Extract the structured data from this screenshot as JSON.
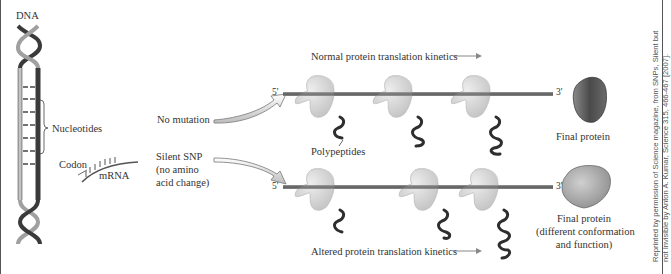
{
  "figure": {
    "labels": {
      "dna": "DNA",
      "nucleotides": "Nucleotides",
      "codon": "Codon",
      "mrna": "mRNA",
      "no_mutation": "No mutation",
      "silent_snp_line1": "Silent SNP",
      "silent_snp_line2": "(no amino",
      "silent_snp_line3": "acid change)",
      "normal_kinetics": "Normal protein translation kinetics",
      "altered_kinetics": "Altered protein translation kinetics",
      "polypeptides": "Polypeptides",
      "five_prime_top": "5'",
      "three_prime_top": "3'",
      "five_prime_bottom": "5'",
      "three_prime_bottom": "3'",
      "final_protein_top": "Final protein",
      "final_protein_bottom_line1": "Final protein",
      "final_protein_bottom_line2": "(different conformation",
      "final_protein_bottom_line3": "and function)"
    },
    "credit": {
      "line1": "Reprinted by permission of Science magazine, from SNPs, Silent but",
      "line2": "not Invisible by Anton A. Kumar, Science 315, 466-467 [2007]."
    },
    "colors": {
      "strand_dark": "#3a3a3a",
      "strand_light": "#9a9a9a",
      "ribosome": "#d9d9d9",
      "protein_normal": "#5e5e5e",
      "protein_altered": "#a8a8a8",
      "mrna_line": "#6b6b6b"
    }
  }
}
